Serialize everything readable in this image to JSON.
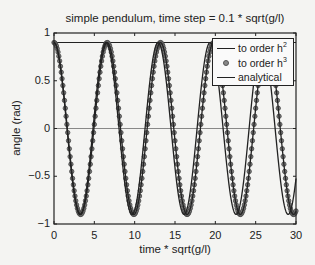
{
  "chart_data": {
    "type": "line",
    "title": "simple pendulum, time step = 0.1 * sqrt(g/l)",
    "xlabel": "time * sqrt(g/l)",
    "ylabel": "angle (rad)",
    "xlim": [
      0,
      30
    ],
    "ylim": [
      -1,
      1
    ],
    "xticks": [
      0,
      5,
      10,
      15,
      20,
      25,
      30
    ],
    "xtick_labels": [
      "0",
      "5",
      "10",
      "15",
      "20",
      "25",
      "30"
    ],
    "yticks": [
      -1,
      -0.5,
      0,
      0.5,
      1
    ],
    "ytick_labels": [
      "−1",
      "−0.5",
      "0",
      "0.5",
      "1"
    ],
    "grid": false,
    "legend_position": "upper right",
    "reference_lines": [
      {
        "y": 0,
        "color": "#888888"
      },
      {
        "y": 0.9,
        "color": "#222222"
      }
    ],
    "series": [
      {
        "name": "to order h^2",
        "style": "line",
        "color": "#222222",
        "amplitude": 0.9,
        "period": 6.45,
        "time_step": 0.1
      },
      {
        "name": "to order h^3",
        "style": "circle-markers",
        "color": "#555555",
        "amplitude": 0.9,
        "period": 6.6,
        "time_step": 0.1
      },
      {
        "name": "analytical",
        "style": "line",
        "color": "#222222",
        "amplitude": 0.9,
        "period": 6.6
      }
    ],
    "approx_values": {
      "x": [
        0,
        3.3,
        6.6,
        9.9,
        13.2,
        16.5,
        19.8,
        23.1,
        26.4,
        29.7,
        30
      ],
      "analytical": [
        0.9,
        -0.9,
        0.9,
        -0.9,
        0.9,
        -0.9,
        0.9,
        -0.9,
        0.9,
        -0.9,
        -0.86
      ],
      "h3": [
        0.9,
        -0.9,
        0.9,
        -0.9,
        0.9,
        -0.9,
        0.9,
        -0.9,
        0.9,
        -0.9,
        -0.86
      ],
      "h2_trough_times": [
        3.2,
        9.7,
        16.1,
        22.6,
        29.0
      ]
    }
  },
  "legend": {
    "items": [
      {
        "label": "to order h",
        "sup": "2"
      },
      {
        "label": "to order h",
        "sup": "3"
      },
      {
        "label": "analytical",
        "sup": ""
      }
    ]
  }
}
